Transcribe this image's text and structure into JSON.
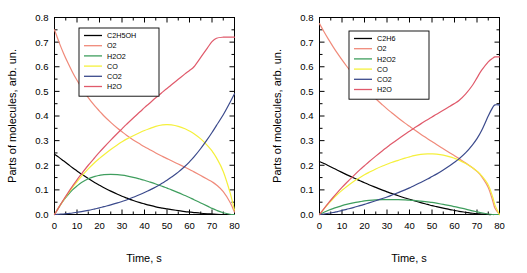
{
  "figure": {
    "background_color": "#ffffff",
    "panel_count": 2
  },
  "colors": {
    "c2h5oh": "#000000",
    "c2h6": "#000000",
    "o2": "#f08a7a",
    "h2o2": "#3f9e5e",
    "co": "#f5f03c",
    "co2": "#3b4a8c",
    "h2o": "#e05a6b",
    "axis": "#000000",
    "frame": "#000000"
  },
  "axes": {
    "xlabel": "Time, s",
    "ylabel": "Parts of molecules, arb. un.",
    "xticks": [
      "0",
      "10",
      "20",
      "30",
      "40",
      "50",
      "60",
      "70",
      "80"
    ],
    "yticks": [
      "0.0",
      "0.1",
      "0.2",
      "0.3",
      "0.4",
      "0.5",
      "0.6",
      "0.7",
      "0.8"
    ],
    "xlim": [
      0,
      80
    ],
    "ylim": [
      0.0,
      0.8
    ]
  },
  "chart_data": [
    {
      "type": "line",
      "panel": "left",
      "title": "",
      "xlabel": "Time, s",
      "ylabel": "Parts of molecules, arb. un.",
      "xlim": [
        0,
        80
      ],
      "ylim": [
        0.0,
        0.8
      ],
      "grid": false,
      "legend_position": "upper-left-inside",
      "x": [
        0,
        2,
        4,
        6,
        8,
        10,
        12,
        15,
        18,
        20,
        22,
        25,
        28,
        30,
        32,
        35,
        38,
        40,
        42,
        45,
        48,
        50,
        52,
        55,
        58,
        60,
        62,
        65,
        68,
        70,
        72,
        75,
        78,
        80
      ],
      "series": [
        {
          "name": "C2H5OH",
          "color": "#000000",
          "values": [
            0.245,
            0.232,
            0.218,
            0.204,
            0.19,
            0.177,
            0.164,
            0.146,
            0.129,
            0.119,
            0.109,
            0.095,
            0.082,
            0.074,
            0.067,
            0.057,
            0.048,
            0.043,
            0.038,
            0.031,
            0.026,
            0.023,
            0.02,
            0.016,
            0.012,
            0.01,
            0.008,
            0.005,
            0.003,
            0.002,
            0.001,
            0.0,
            0.0,
            0.0
          ]
        },
        {
          "name": "O2",
          "color": "#f08a7a",
          "values": [
            0.75,
            0.7,
            0.655,
            0.615,
            0.578,
            0.545,
            0.515,
            0.475,
            0.44,
            0.42,
            0.4,
            0.374,
            0.35,
            0.336,
            0.322,
            0.303,
            0.286,
            0.275,
            0.265,
            0.25,
            0.236,
            0.227,
            0.218,
            0.205,
            0.192,
            0.183,
            0.173,
            0.158,
            0.143,
            0.133,
            0.12,
            0.093,
            0.05,
            0.01
          ]
        },
        {
          "name": "H2O2",
          "color": "#3f9e5e",
          "values": [
            0.0,
            0.03,
            0.057,
            0.08,
            0.1,
            0.116,
            0.13,
            0.145,
            0.155,
            0.159,
            0.162,
            0.163,
            0.162,
            0.16,
            0.157,
            0.151,
            0.144,
            0.139,
            0.133,
            0.124,
            0.114,
            0.107,
            0.1,
            0.089,
            0.077,
            0.069,
            0.06,
            0.047,
            0.034,
            0.025,
            0.017,
            0.007,
            0.001,
            0.0
          ]
        },
        {
          "name": "CO",
          "color": "#f5f03c",
          "values": [
            0.0,
            0.03,
            0.058,
            0.085,
            0.11,
            0.133,
            0.155,
            0.185,
            0.212,
            0.228,
            0.243,
            0.264,
            0.283,
            0.295,
            0.306,
            0.32,
            0.333,
            0.341,
            0.348,
            0.358,
            0.364,
            0.365,
            0.364,
            0.358,
            0.348,
            0.339,
            0.328,
            0.307,
            0.28,
            0.258,
            0.23,
            0.175,
            0.09,
            0.018
          ]
        },
        {
          "name": "CO2",
          "color": "#3b4a8c",
          "values": [
            0.0,
            0.001,
            0.002,
            0.004,
            0.006,
            0.009,
            0.012,
            0.017,
            0.023,
            0.027,
            0.032,
            0.039,
            0.047,
            0.053,
            0.059,
            0.07,
            0.081,
            0.089,
            0.098,
            0.112,
            0.128,
            0.139,
            0.152,
            0.172,
            0.196,
            0.214,
            0.234,
            0.268,
            0.306,
            0.333,
            0.362,
            0.405,
            0.455,
            0.49
          ]
        },
        {
          "name": "H2O",
          "color": "#e05a6b",
          "values": [
            0.0,
            0.03,
            0.06,
            0.088,
            0.115,
            0.141,
            0.165,
            0.2,
            0.232,
            0.253,
            0.273,
            0.302,
            0.33,
            0.348,
            0.366,
            0.392,
            0.417,
            0.434,
            0.45,
            0.474,
            0.497,
            0.512,
            0.527,
            0.549,
            0.571,
            0.585,
            0.6,
            0.638,
            0.677,
            0.702,
            0.716,
            0.72,
            0.72,
            0.72
          ]
        }
      ]
    },
    {
      "type": "line",
      "panel": "right",
      "title": "",
      "xlabel": "Time, s",
      "ylabel": "Parts of molecules, arb. un.",
      "xlim": [
        0,
        80
      ],
      "ylim": [
        0.0,
        0.8
      ],
      "grid": false,
      "legend_position": "upper-left-inside",
      "x": [
        0,
        2,
        4,
        6,
        8,
        10,
        12,
        15,
        18,
        20,
        22,
        25,
        28,
        30,
        32,
        35,
        38,
        40,
        42,
        45,
        48,
        50,
        52,
        55,
        58,
        60,
        62,
        65,
        68,
        70,
        72,
        75,
        77,
        78,
        80
      ],
      "series": [
        {
          "name": "C2H6",
          "color": "#000000",
          "values": [
            0.215,
            0.207,
            0.198,
            0.189,
            0.18,
            0.171,
            0.162,
            0.149,
            0.137,
            0.129,
            0.121,
            0.11,
            0.099,
            0.092,
            0.086,
            0.076,
            0.067,
            0.062,
            0.056,
            0.048,
            0.041,
            0.036,
            0.032,
            0.026,
            0.02,
            0.017,
            0.013,
            0.009,
            0.005,
            0.003,
            0.002,
            0.0,
            0.0,
            0.0,
            0.0
          ]
        },
        {
          "name": "O2",
          "color": "#f08a7a",
          "values": [
            0.775,
            0.742,
            0.711,
            0.682,
            0.654,
            0.628,
            0.603,
            0.568,
            0.536,
            0.516,
            0.497,
            0.47,
            0.445,
            0.429,
            0.414,
            0.392,
            0.371,
            0.358,
            0.345,
            0.326,
            0.308,
            0.296,
            0.284,
            0.267,
            0.25,
            0.239,
            0.227,
            0.209,
            0.19,
            0.175,
            0.155,
            0.11,
            0.055,
            0.025,
            0.0
          ]
        },
        {
          "name": "H2O2",
          "color": "#3f9e5e",
          "values": [
            0.0,
            0.009,
            0.017,
            0.024,
            0.03,
            0.036,
            0.041,
            0.047,
            0.052,
            0.055,
            0.057,
            0.059,
            0.06,
            0.06,
            0.06,
            0.06,
            0.059,
            0.058,
            0.057,
            0.054,
            0.051,
            0.049,
            0.046,
            0.041,
            0.036,
            0.032,
            0.028,
            0.022,
            0.015,
            0.011,
            0.007,
            0.002,
            0.0,
            0.0,
            0.0
          ]
        },
        {
          "name": "CO",
          "color": "#f5f03c",
          "values": [
            0.0,
            0.023,
            0.044,
            0.064,
            0.082,
            0.098,
            0.113,
            0.133,
            0.15,
            0.161,
            0.171,
            0.185,
            0.197,
            0.204,
            0.211,
            0.22,
            0.229,
            0.234,
            0.239,
            0.244,
            0.246,
            0.246,
            0.245,
            0.241,
            0.234,
            0.228,
            0.221,
            0.207,
            0.19,
            0.176,
            0.158,
            0.12,
            0.07,
            0.038,
            0.0
          ]
        },
        {
          "name": "CO2",
          "color": "#3b4a8c",
          "values": [
            0.0,
            0.002,
            0.005,
            0.008,
            0.012,
            0.016,
            0.021,
            0.028,
            0.036,
            0.041,
            0.047,
            0.056,
            0.065,
            0.071,
            0.078,
            0.089,
            0.1,
            0.108,
            0.117,
            0.13,
            0.144,
            0.154,
            0.164,
            0.181,
            0.199,
            0.212,
            0.226,
            0.251,
            0.283,
            0.308,
            0.34,
            0.4,
            0.435,
            0.445,
            0.445
          ]
        },
        {
          "name": "H2O",
          "color": "#e05a6b",
          "values": [
            0.0,
            0.024,
            0.047,
            0.069,
            0.09,
            0.11,
            0.129,
            0.156,
            0.182,
            0.198,
            0.214,
            0.237,
            0.259,
            0.273,
            0.287,
            0.307,
            0.326,
            0.338,
            0.35,
            0.368,
            0.385,
            0.396,
            0.407,
            0.423,
            0.44,
            0.451,
            0.463,
            0.49,
            0.525,
            0.555,
            0.585,
            0.62,
            0.635,
            0.64,
            0.64
          ]
        }
      ]
    }
  ],
  "legends": [
    {
      "panel": "left",
      "entries": [
        {
          "label": "C2H5OH",
          "color": "#000000"
        },
        {
          "label": "O2",
          "color": "#f08a7a"
        },
        {
          "label": "H2O2",
          "color": "#3f9e5e"
        },
        {
          "label": "CO",
          "color": "#f5f03c"
        },
        {
          "label": "CO2",
          "color": "#3b4a8c"
        },
        {
          "label": "H2O",
          "color": "#e05a6b"
        }
      ]
    },
    {
      "panel": "right",
      "entries": [
        {
          "label": "C2H6",
          "color": "#000000"
        },
        {
          "label": "O2",
          "color": "#f08a7a"
        },
        {
          "label": "H2O2",
          "color": "#3f9e5e"
        },
        {
          "label": "CO",
          "color": "#f5f03c"
        },
        {
          "label": "CO2",
          "color": "#3b4a8c"
        },
        {
          "label": "H2O",
          "color": "#e05a6b"
        }
      ]
    }
  ]
}
